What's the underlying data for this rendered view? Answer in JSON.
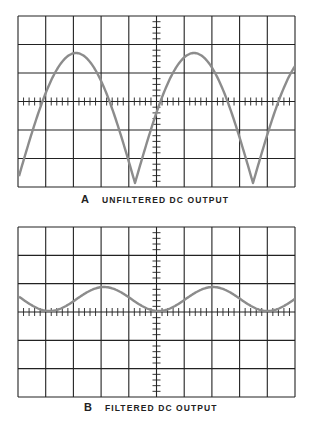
{
  "panels": [
    {
      "id": "A",
      "letter": "A",
      "title": "UNFILTERED DC OUTPUT",
      "grid": {
        "x0": 18,
        "y0": 16,
        "width": 277,
        "height": 171,
        "cols": 10,
        "rows": 6
      },
      "caption_pos": {
        "x": 81,
        "y": 193
      },
      "trace_color": "#8c8c8c",
      "waveform": "full-wave rectified (unfiltered)",
      "trace": {
        "type": "abs-sine",
        "period_px": 118,
        "trough_x": 135,
        "peak_y": 53,
        "trough_y": 183
      }
    },
    {
      "id": "B",
      "letter": "B",
      "title": "FILTERED DC OUTPUT",
      "grid": {
        "x0": 18,
        "y0": 227,
        "width": 277,
        "height": 170,
        "cols": 10,
        "rows": 6
      },
      "caption_pos": {
        "x": 84,
        "y": 401
      },
      "trace_color": "#8c8c8c",
      "waveform": "filtered ripple",
      "trace": {
        "type": "sine",
        "period_px": 109,
        "peak_x": 104,
        "peak_y": 287,
        "trough_y": 311
      }
    }
  ],
  "colors": {
    "grid": "#222222",
    "trace": "#8c8c8c",
    "background": "#ffffff"
  }
}
